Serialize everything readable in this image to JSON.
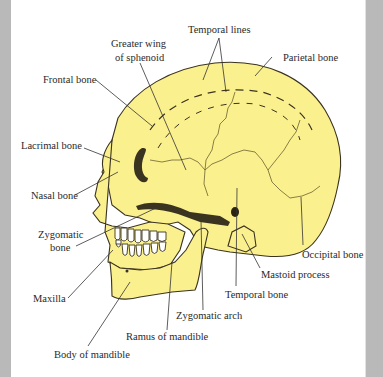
{
  "figure": {
    "colors": {
      "bone_fill": "#fbf08e",
      "outline": "#3a3320",
      "suture": "#6b6232",
      "leader_line": "#333333",
      "page_border": "#b9b9b9",
      "teeth": "#ffffff"
    },
    "labels": {
      "temporal_lines": "Temporal lines",
      "greater_wing_line1": "Greater wing",
      "greater_wing_line2": "of sphenoid",
      "parietal_bone": "Parietal bone",
      "frontal_bone": "Frontal bone",
      "lacrimal_bone": "Lacrimal bone",
      "nasal_bone": "Nasal bone",
      "zygomatic_bone_line1": "Zygomatic",
      "zygomatic_bone_line2": "bone",
      "maxilla": "Maxilla",
      "occipital_bone": "Occipital bone",
      "mastoid_process": "Mastoid process",
      "temporal_bone": "Temporal bone",
      "zygomatic_arch": "Zygomatic arch",
      "ramus_of_mandible": "Ramus of mandible",
      "body_of_mandible": "Body of mandible"
    }
  }
}
